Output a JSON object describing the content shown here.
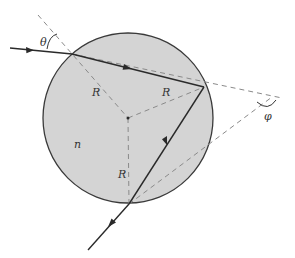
{
  "figure": {
    "medium_label": "n",
    "incidence_angle_label": "θ",
    "deviation_angle_label": "φ",
    "radius_labels": [
      "R",
      "R",
      "R"
    ]
  },
  "colors": {
    "sphere_fill": "#d4d4d4",
    "sphere_stroke": "#3a3a3a",
    "ray": "#2a2a2a",
    "dashed": "#8a8a8a",
    "text": "#333333"
  }
}
